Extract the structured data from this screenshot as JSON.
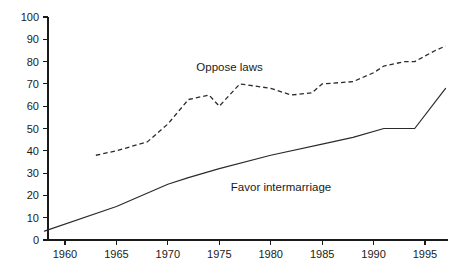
{
  "chart_data": {
    "type": "line",
    "title": "",
    "subtitle": "",
    "xlabel": "",
    "ylabel": "",
    "xlim": [
      1957,
      1998
    ],
    "ylim": [
      0,
      100
    ],
    "ytick_step": 10,
    "xtick_step": 5,
    "grid": false,
    "legend_position": "inline-annotation",
    "yticks": [
      "0",
      "10",
      "20",
      "30",
      "40",
      "50",
      "60",
      "70",
      "80",
      "90",
      "100"
    ],
    "xticks": [
      "1960",
      "1965",
      "1970",
      "1975",
      "1980",
      "1985",
      "1990",
      "1995"
    ],
    "series": [
      {
        "name": "Oppose laws",
        "style": "dashed",
        "color": "#2b2b2b",
        "label_x": 1976,
        "label_y": 76,
        "x": [
          1963,
          1965,
          1968,
          1970,
          1972,
          1974,
          1975,
          1977,
          1980,
          1982,
          1984,
          1985,
          1988,
          1990,
          1991,
          1993,
          1994,
          1996,
          1997
        ],
        "values": [
          38,
          40,
          44,
          52,
          63,
          65,
          60,
          70,
          68,
          65,
          66,
          70,
          71,
          75,
          78,
          80,
          80,
          85,
          87
        ]
      },
      {
        "name": "Favor intermarriage",
        "style": "solid",
        "color": "#2b2b2b",
        "label_x": 1981,
        "label_y": 22,
        "x": [
          1958,
          1965,
          1970,
          1972,
          1975,
          1980,
          1985,
          1988,
          1991,
          1994,
          1997
        ],
        "values": [
          4,
          15,
          25,
          28,
          32,
          38,
          43,
          46,
          50,
          50,
          68
        ]
      }
    ]
  },
  "labels": {
    "oppose_laws": "Oppose laws",
    "favor_intermarriage": "Favor intermarriage"
  }
}
